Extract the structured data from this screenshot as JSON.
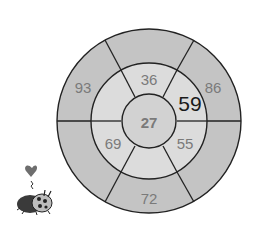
{
  "diagram": {
    "type": "bullseye",
    "colors": {
      "outer_ring": "#c4c4c4",
      "middle_ring": "#dcdcdc",
      "center": "#d2d2d2",
      "stroke": "#222222",
      "text": "#7a7a7a",
      "highlight_text": "#1a1a1a"
    },
    "center": {
      "value": "27"
    },
    "middle_ring": {
      "top": "36",
      "upper_right": "59",
      "lower_right": "55",
      "bottom": "",
      "lower_left": "69",
      "upper_left": ""
    },
    "outer_ring": {
      "top": "",
      "upper_right": "86",
      "lower_right": "",
      "bottom": "72",
      "lower_left": "",
      "upper_left": "93"
    }
  },
  "decoration": {
    "icon": "ladybug-with-heart-icon"
  }
}
